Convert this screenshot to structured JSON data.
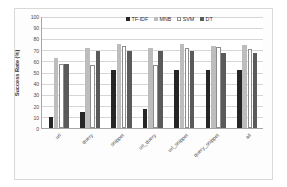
{
  "chart_data": {
    "type": "bar",
    "title": "",
    "subtitle": "",
    "xlabel": "",
    "ylabel": "Success Rate (%)",
    "ylim": [
      0,
      100
    ],
    "ytick_step": 10,
    "yticks": [
      "100",
      "90",
      "80",
      "70",
      "60",
      "50",
      "40",
      "30",
      "20",
      "10",
      "0"
    ],
    "grid": true,
    "legend_position": "top-right",
    "categories": [
      "url",
      "query",
      "snippet",
      "url_query",
      "url_snippet",
      "query_snippet",
      "all"
    ],
    "series": [
      {
        "name": "TF-IDF",
        "color": "#262626",
        "values": [
          10,
          14,
          52,
          17,
          52,
          52,
          52
        ]
      },
      {
        "name": "MNB",
        "color": "#bdbdbd",
        "values": [
          63,
          72,
          76,
          72,
          76,
          74,
          75
        ]
      },
      {
        "name": "SVM",
        "color": "#ffffff",
        "values": [
          58,
          57,
          74,
          57,
          72,
          73,
          71
        ]
      },
      {
        "name": "DT",
        "color": "#5a5a5a",
        "values": [
          58,
          69,
          69,
          69,
          69,
          68,
          68
        ]
      }
    ]
  },
  "legend": {
    "items": [
      {
        "label": "TF-IDF"
      },
      {
        "label": "MNB"
      },
      {
        "label": "SVM"
      },
      {
        "label": "DT"
      }
    ]
  },
  "axis": {
    "y_title": "Success Rate (%)"
  },
  "colors": {
    "tfidf": "#262626",
    "mnb": "#bdbdbd",
    "svm": "#ffffff",
    "dt": "#5a5a5a",
    "grid": "#d6d6d6",
    "axis": "#a6a6a6",
    "frame": "#d9d9d9"
  }
}
